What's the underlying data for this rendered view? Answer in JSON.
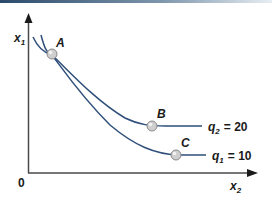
{
  "colors": {
    "axis": "#4a4a4a",
    "curve": "#2f4f7a",
    "point_fill": "#c9c9c9",
    "point_stroke": "#8a8a8a",
    "topbar_start": "#2b4a6b",
    "topbar_end": "#e8eef3"
  },
  "axes": {
    "y_label": "x",
    "y_label_sub": "1",
    "x_label": "x",
    "x_label_sub": "2",
    "origin_label": "0"
  },
  "curves": [
    {
      "name": "q2",
      "label_var": "q",
      "label_sub": "2",
      "label_eq": "= 20"
    },
    {
      "name": "q1",
      "label_var": "q",
      "label_sub": "1",
      "label_eq": "= 10"
    }
  ],
  "points": [
    {
      "label": "A"
    },
    {
      "label": "B"
    },
    {
      "label": "C"
    }
  ]
}
